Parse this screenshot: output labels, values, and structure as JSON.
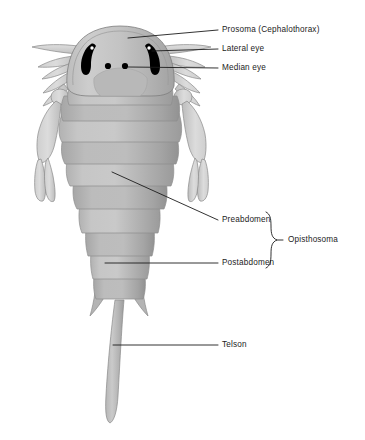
{
  "figure": {
    "background_color": "#ffffff",
    "line_color": "#1c1c1c",
    "body_colors": {
      "carapace_light": "#c9c9c9",
      "carapace_mid": "#b4b4b4",
      "carapace_dark": "#9e9e9e",
      "segment_shadow": "#a0a0a0",
      "appendage_light": "#d2d2d2",
      "appendage_mid": "#bdbdbd",
      "outline": "#6f6f6f",
      "eye_color": "#000000",
      "eye_highlight": "#ffffff"
    }
  },
  "labels": {
    "prosoma": "Prosoma (Cephalothorax)",
    "lateral_eye": "Lateral eye",
    "median_eye": "Median eye",
    "preabdomen": "Preabdomen",
    "postabdomen": "Postabdomen",
    "opisthosoma": "Opisthosoma",
    "telson": "Telson"
  },
  "label_positions": {
    "prosoma": {
      "x": 222,
      "y": 25
    },
    "lateral_eye": {
      "x": 222,
      "y": 44
    },
    "median_eye": {
      "x": 222,
      "y": 63
    },
    "preabdomen": {
      "x": 222,
      "y": 215
    },
    "postabdomen": {
      "x": 222,
      "y": 258
    },
    "opisthosoma": {
      "x": 288,
      "y": 239
    },
    "telson": {
      "x": 222,
      "y": 340
    }
  },
  "anatomy_parts": [
    "prosoma",
    "lateral_eye",
    "median_eye",
    "preabdomen",
    "postabdomen",
    "opisthosoma",
    "telson"
  ]
}
